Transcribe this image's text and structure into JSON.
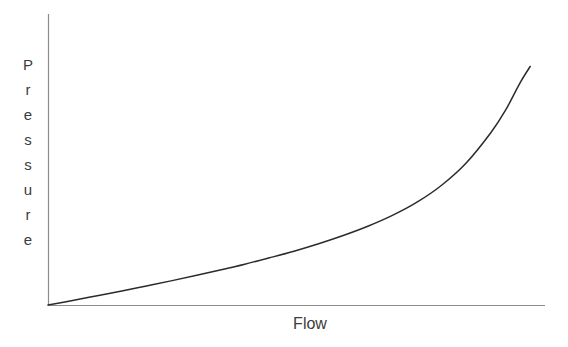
{
  "figure": {
    "background_color": "#ffffff",
    "axis_color": "#8c8c8c",
    "curve_color": "#2b2b2b",
    "label_color": "#3c3c3c"
  },
  "axis_titles": {
    "y": "Pressure",
    "x": "Flow"
  },
  "chart_data": {
    "type": "line",
    "title": "",
    "subtitle": "",
    "xlabel": "Flow",
    "ylabel": "Pressure",
    "xlim": [
      0,
      1
    ],
    "ylim": [
      0,
      1
    ],
    "grid": false,
    "legend": null,
    "axis_ticks": {
      "x": [],
      "y": []
    },
    "annotations": [],
    "series": [
      {
        "name": "Pressure vs Flow",
        "color": "#2b2b2b",
        "line_width": 1.5,
        "x": [
          0.0,
          0.05,
          0.1,
          0.15,
          0.2,
          0.25,
          0.3,
          0.35,
          0.4,
          0.45,
          0.5,
          0.55,
          0.6,
          0.65,
          0.7,
          0.75,
          0.8,
          0.85,
          0.9,
          0.93,
          0.96,
          0.98
        ],
        "y": [
          0.0,
          0.017,
          0.035,
          0.053,
          0.072,
          0.091,
          0.111,
          0.132,
          0.154,
          0.178,
          0.203,
          0.231,
          0.262,
          0.297,
          0.338,
          0.388,
          0.452,
          0.536,
          0.65,
          0.735,
          0.84,
          0.9
        ]
      }
    ]
  },
  "geometry": {
    "y_axis": {
      "x": 48,
      "y_top": 14,
      "y_bottom": 305
    },
    "x_axis": {
      "y": 305,
      "x_left": 48,
      "x_right": 545
    },
    "curve_path": "M 48 305 L 70 301.4 L 92 297.7 L 114 293.9 L 136 289.9 L 158 285.8 L 180 281.5 L 202 277.1 L 224 272.4 L 246 267.4 L 268 262.1 L 290 256.3 L 312 249.9 L 334 242.7 L 356 234.3 L 378 224.1 L 400 210.8 L 422 193.5 L 444 169.8 L 466 152.1 L 488 130.3 L 510 99.0 L 534 44.0"
  }
}
